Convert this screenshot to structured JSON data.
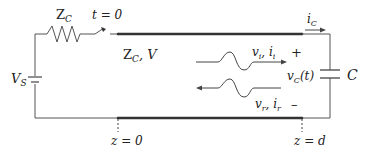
{
  "diagram": {
    "labels": {
      "source_impedance": "Z",
      "source_impedance_sub": "C",
      "switch_time": "t = 0",
      "line_param_z": "Z",
      "line_param_sub": "C",
      "line_param_v": ", V",
      "source_voltage": "V",
      "source_voltage_sub": "S",
      "incident_wave": "v",
      "incident_wave_sub": "i",
      "incident_sep": ", i",
      "incident_sep_sub": "i",
      "reflected_wave": "v",
      "reflected_wave_sub": "r",
      "reflected_sep": ", i",
      "reflected_sep_sub": "r",
      "cap_current": "i",
      "cap_current_sub": "C",
      "cap_voltage": "v",
      "cap_voltage_sub": "C",
      "cap_voltage_arg": "(t)",
      "capacitor": "C",
      "plus_sign": "+",
      "minus_sign": "–",
      "position_start": "z = 0",
      "position_end": "z = d"
    },
    "colors": {
      "wire": "#555555",
      "line": "#333333",
      "text": "#222222"
    }
  }
}
